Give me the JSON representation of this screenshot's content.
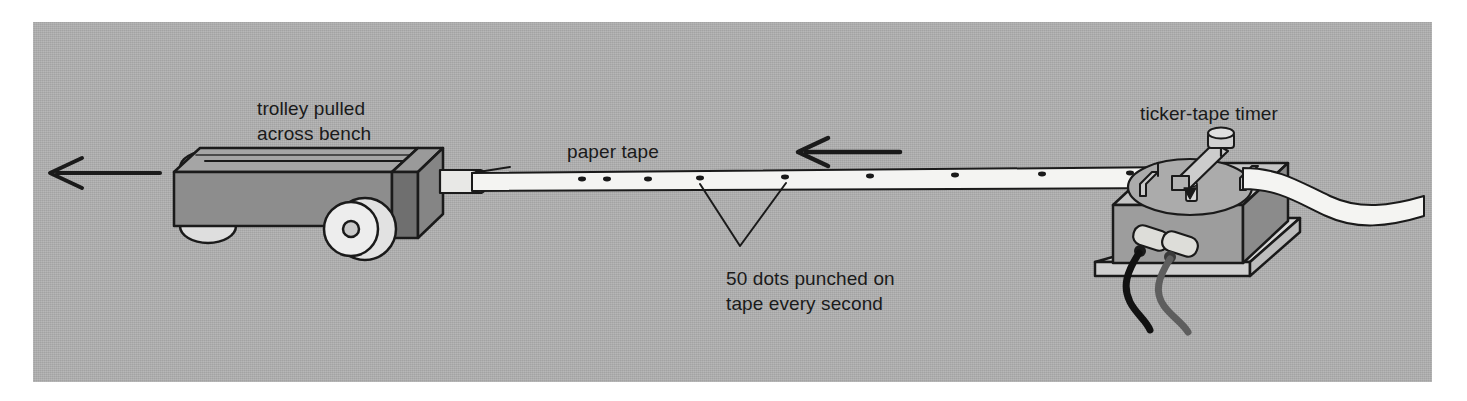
{
  "figure": {
    "panel_color": "#b0b0b0",
    "page_color": "#ffffff",
    "ink_color": "#1a1a1a"
  },
  "labels": {
    "trolley": "trolley pulled\nacross bench",
    "paper_tape": "paper tape",
    "dots": "50 dots punched on\ntape every second",
    "timer": "ticker-tape timer"
  },
  "annotations": {
    "pull_arrow_direction": "left",
    "tape_motion_arrow_direction": "left",
    "dots_per_second": 50
  },
  "parts": {
    "trolley_body_color": "#8e8e8e",
    "trolley_top_color": "#a3a3a3",
    "trolley_rear_block_color": "#7c7c7c",
    "wheel_color": "#dcdcdc",
    "tape_color": "#f2f2f0",
    "timer_body_color": "#9b9b9b",
    "timer_top_color": "#c3c3c3",
    "timer_base_color": "#d2d2d2",
    "carbon_disc_color": "#a8a8a8",
    "wire_black": "#111111",
    "wire_grey": "#5a5a5a"
  },
  "tape": {
    "dot_positions_px": [
      582,
      607,
      648,
      700,
      785,
      870,
      955,
      1042,
      1130
    ],
    "leader_dots_px": [
      700,
      785
    ]
  }
}
